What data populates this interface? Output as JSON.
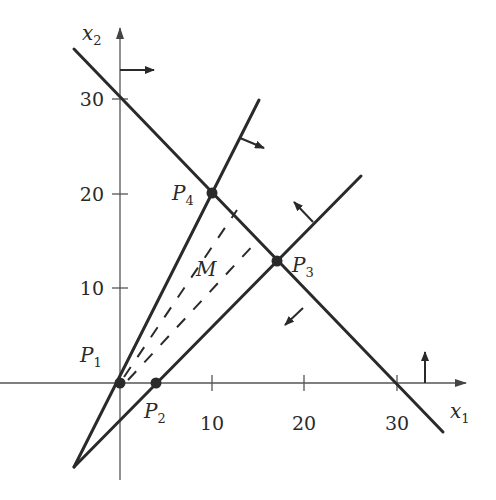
{
  "figure": {
    "axes": {
      "x_label": "x",
      "x_label_sub": "1",
      "y_label": "x",
      "y_label_sub": "2",
      "x_ticks": [
        "10",
        "20",
        "30"
      ],
      "y_ticks": [
        "10",
        "20",
        "30"
      ]
    },
    "points": [
      {
        "name": "P",
        "sub": "1",
        "x1": 0,
        "x2": 0
      },
      {
        "name": "P",
        "sub": "2",
        "x1": 4,
        "x2": 0
      },
      {
        "name": "P",
        "sub": "3",
        "x1": 17,
        "x2": 13
      },
      {
        "name": "P",
        "sub": "4",
        "x1": 10,
        "x2": 20
      }
    ],
    "region_label": "M",
    "colors": {
      "line": "#2a2a2a",
      "axis": "#555555",
      "background": "#ffffff"
    }
  }
}
